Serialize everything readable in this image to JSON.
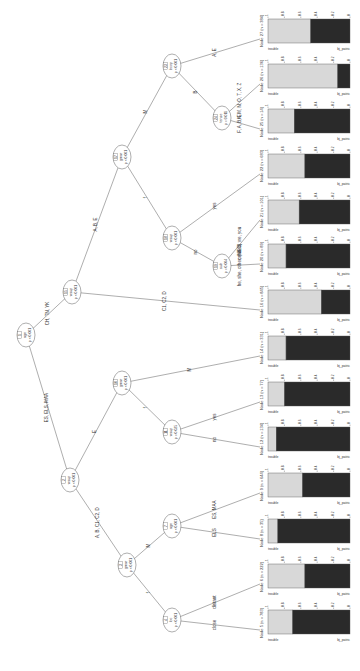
{
  "diagram": {
    "type": "conditional-inference-tree",
    "orientation": "rotated-90",
    "inner_nodes": [
      {
        "id": "1",
        "var": "age",
        "p": "p < 0.001"
      },
      {
        "id": "2",
        "var": "wsup",
        "p": "p < 0.001"
      },
      {
        "id": "3",
        "var": "gmar",
        "p": "p < 0.001"
      },
      {
        "id": "4",
        "var": "loc",
        "p": "p < 0.001"
      },
      {
        "id": "7",
        "var": "age",
        "p": "p < 0.001"
      },
      {
        "id": "10",
        "var": "gmar",
        "p": "p < 0.001"
      },
      {
        "id": "11",
        "var": "wsup",
        "p": "p = 0.025"
      },
      {
        "id": "15",
        "var": "wsup",
        "p": "p < 0.001"
      },
      {
        "id": "17",
        "var": "gmar",
        "p": "p < 0.001"
      },
      {
        "id": "18",
        "var": "wsup",
        "p": "p < 0.001"
      },
      {
        "id": "19",
        "var": "sub",
        "p": "p = 0.004"
      },
      {
        "id": "23",
        "var": "bcop",
        "p": "p < 0.001"
      },
      {
        "id": "24",
        "var": "tense",
        "p": "p = 0.011"
      }
    ],
    "edges": [
      {
        "from": "1",
        "to": "2",
        "label": "ES, ELS, MAA"
      },
      {
        "from": "1",
        "to": "15",
        "label": "CH, TN, YK"
      },
      {
        "from": "2",
        "to": "3",
        "label": "A, B, C1, C2, D"
      },
      {
        "from": "2",
        "to": "10",
        "label": "E"
      },
      {
        "from": "3",
        "to": "4",
        "label": "f"
      },
      {
        "from": "3",
        "to": "7",
        "label": "M"
      },
      {
        "from": "4",
        "to": "5",
        "label": "close"
      },
      {
        "from": "4",
        "to": "6",
        "label": "distant"
      },
      {
        "from": "7",
        "to": "8",
        "label": "ELS"
      },
      {
        "from": "7",
        "to": "9",
        "label": "ES, MAA"
      },
      {
        "from": "10",
        "to": "11",
        "label": "f"
      },
      {
        "from": "10",
        "to": "14",
        "label": "M"
      },
      {
        "from": "11",
        "to": "12",
        "label": "no"
      },
      {
        "from": "11",
        "to": "13",
        "label": "yes"
      },
      {
        "from": "15",
        "to": "16",
        "label": "C1, C2, D"
      },
      {
        "from": "15",
        "to": "17",
        "label": "A, B, E"
      },
      {
        "from": "17",
        "to": "18",
        "label": "f"
      },
      {
        "from": "17",
        "to": "23",
        "label": "M"
      },
      {
        "from": "18",
        "to": "19",
        "label": "no"
      },
      {
        "from": "18",
        "to": "22",
        "label": "yes"
      },
      {
        "from": "19",
        "to": "20",
        "label": "he, she, other, (NEC)"
      },
      {
        "from": "19",
        "to": "21",
        "label": "omitted, we, you"
      },
      {
        "from": "23",
        "to": "24",
        "label": "B"
      },
      {
        "from": "23",
        "to": "27",
        "label": "A, E"
      },
      {
        "from": "24",
        "to": "25",
        "label": "F, A, B, E"
      },
      {
        "from": "24",
        "to": "26",
        "label": "K, M, N, O, T, X, Z"
      }
    ],
    "leaf_axis": {
      "ticks": [
        "0",
        "0.2",
        "0.4",
        "0.6",
        "0.8",
        "1"
      ],
      "cat_top": "trouble",
      "cat_bottom": "bj_patric"
    }
  },
  "chart_data": {
    "type": "bar",
    "xlabel": "",
    "ylabel": "proportion",
    "ylim": [
      0,
      1
    ],
    "categories": [
      "Node 5",
      "Node 6",
      "Node 8",
      "Node 9",
      "Node 12",
      "Node 13",
      "Node 14",
      "Node 16",
      "Node 20",
      "Node 21",
      "Node 22",
      "Node 25",
      "Node 26",
      "Node 27"
    ],
    "series": [
      {
        "name": "trouble",
        "values": [
          0.3,
          0.45,
          0.12,
          0.42,
          0.1,
          0.2,
          0.22,
          0.65,
          0.22,
          0.38,
          0.45,
          0.32,
          0.85,
          0.52
        ]
      },
      {
        "name": "bj_patric",
        "values": [
          0.7,
          0.55,
          0.88,
          0.58,
          0.9,
          0.8,
          0.78,
          0.35,
          0.78,
          0.62,
          0.55,
          0.68,
          0.15,
          0.48
        ]
      }
    ],
    "leaf_labels": [
      "Node 5 (n = 783)",
      "Node 6 (n = 222)",
      "Node 8 (n = 35)",
      "Node 9 (n = 644)",
      "Node 12 (n = 134)",
      "Node 13 (n = 77)",
      "Node 14 (n = 331)",
      "Node 16 (n = 845)",
      "Node 20 (n = 89)",
      "Node 21 (n = 101)",
      "Node 22 (n = 683)",
      "Node 25 (n = 14)",
      "Node 26 (n = 136)",
      "Node 27 (n = 384)"
    ]
  }
}
